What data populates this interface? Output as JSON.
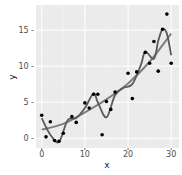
{
  "chart_data": {
    "type": "scatter",
    "title": "",
    "xlabel": "x",
    "ylabel": "y",
    "xlim": [
      -1.5,
      31.5
    ],
    "ylim": [
      -1.2,
      18.2
    ],
    "x_ticks": [
      0,
      10,
      20,
      30
    ],
    "y_ticks": [
      0,
      5,
      10,
      15
    ],
    "x_tick_labels": [
      "0",
      "10",
      "20",
      "30"
    ],
    "y_tick_labels": [
      "0 -",
      "5 -",
      "10 -",
      "15 -"
    ],
    "grid": true,
    "legend": null,
    "points": {
      "x": [
        0,
        1,
        2,
        3,
        4,
        5,
        7,
        8,
        10,
        11,
        12,
        13,
        14,
        15,
        16,
        17,
        20,
        21,
        22,
        24,
        25,
        26,
        27,
        28,
        29,
        30
      ],
      "y": [
        3.2,
        0.2,
        2.3,
        -0.3,
        -0.4,
        0.7,
        3.0,
        2.2,
        4.9,
        4.2,
        6.1,
        6.1,
        0.5,
        5.1,
        4.0,
        6.4,
        9.0,
        5.5,
        9.2,
        11.9,
        10.4,
        13.4,
        9.3,
        15.1,
        17.2,
        10.4
      ]
    },
    "series": [
      {
        "name": "smooth fit",
        "type": "line",
        "color": "#808080",
        "x": [
          0,
          5,
          10,
          15,
          20,
          25,
          30
        ],
        "y": [
          1.2,
          2.0,
          3.6,
          5.4,
          7.6,
          10.6,
          14.5
        ]
      },
      {
        "name": "wiggly fit",
        "type": "line",
        "color": "#5a5a5a",
        "x": [
          0,
          2,
          4,
          6,
          8,
          10,
          12,
          13,
          15,
          17,
          19,
          21,
          23,
          24,
          26,
          27,
          28,
          29,
          30
        ],
        "y": [
          2.8,
          0.5,
          -0.5,
          2.5,
          2.8,
          4.2,
          6.2,
          5.0,
          2.9,
          6.0,
          7.0,
          7.5,
          10.2,
          12.0,
          11.0,
          13.5,
          15.1,
          14.5,
          11.5
        ]
      }
    ]
  },
  "axis": {
    "x_title": "x",
    "y_title": "y"
  },
  "colors": {
    "panel": "#ebebeb",
    "grid_major": "#ffffff",
    "points": "#000000"
  }
}
